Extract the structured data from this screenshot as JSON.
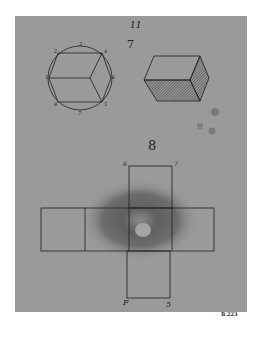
{
  "page": {
    "page_number": "11",
    "stamp": "B.223",
    "paper_color": "#9a9a98",
    "ink_color": "#1e1e1e"
  },
  "figure_7": {
    "number": "7",
    "circle_diagram": {
      "labels": [
        "3",
        "4",
        "2",
        "1",
        "6",
        "8",
        "5",
        "7"
      ]
    },
    "solid_diagram": {
      "description": "shaded rectangular prism"
    }
  },
  "figure_8": {
    "number": "8",
    "net_labels": {
      "top_left": "6",
      "top_right": "7",
      "bottom_left": "F",
      "bottom_right": "5"
    }
  }
}
